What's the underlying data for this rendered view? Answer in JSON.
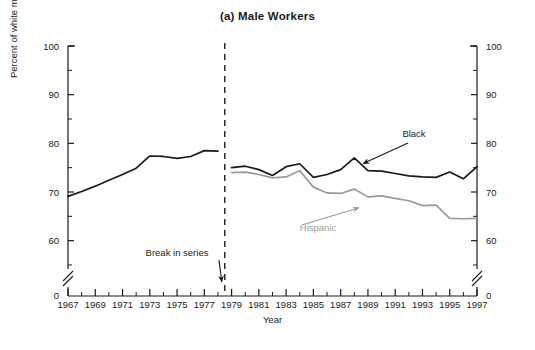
{
  "chart_data": {
    "type": "line",
    "title": "(a) Male Workers",
    "xlabel": "Year",
    "ylabel": "Percent of white male earnings",
    "xlim": [
      1967,
      1997
    ],
    "ylim": [
      0,
      100
    ],
    "y_axis_break": true,
    "y_break_below": 55,
    "grid": false,
    "legend": "inline-annotations",
    "y_major_ticks": [
      0,
      60,
      70,
      80,
      90,
      100
    ],
    "y_minor_ticks": [
      55,
      65,
      75,
      85,
      95
    ],
    "y_tick_labels": [
      "0",
      "60",
      "70",
      "80",
      "90",
      "100"
    ],
    "x_tick_labels": [
      "1967",
      "1969",
      "1971",
      "1973",
      "1975",
      "1977",
      "1979",
      "1981",
      "1983",
      "1985",
      "1987",
      "1989",
      "1991",
      "1993",
      "1995",
      "1997"
    ],
    "x_minor_years": [
      1968,
      1970,
      1972,
      1974,
      1976,
      1978,
      1980,
      1982,
      1984,
      1986,
      1988,
      1990,
      1992,
      1994,
      1996
    ],
    "break_in_series": {
      "label": "Break in series",
      "at_year": 1978.5,
      "style": "dashed-vertical"
    },
    "annotations": [
      {
        "text": "Black",
        "color": "#1a1a1a",
        "points_to_year": 1988.5,
        "points_to_value": 74.6
      },
      {
        "text": "Hispanic",
        "color": "#9a9a9a",
        "points_to_year": 1988.2,
        "points_to_value": 68.2
      }
    ],
    "series": [
      {
        "name": "Black",
        "color": "#1a1a1a",
        "segments": [
          {
            "name": "Black pre-break",
            "x": [
              1967,
              1968,
              1969,
              1970,
              1971,
              1972,
              1973,
              1974,
              1975,
              1976,
              1977,
              1978
            ],
            "y": [
              69.1,
              70.1,
              71.2,
              72.4,
              73.6,
              74.9,
              77.4,
              77.3,
              76.9,
              77.3,
              78.5,
              78.4
            ]
          },
          {
            "name": "Black post-break",
            "x": [
              1979,
              1980,
              1981,
              1982,
              1983,
              1984,
              1985,
              1986,
              1987,
              1988,
              1989,
              1990,
              1991,
              1992,
              1993,
              1994,
              1995,
              1996,
              1997
            ],
            "y": [
              75.0,
              75.3,
              74.6,
              73.4,
              75.2,
              75.8,
              73.0,
              73.6,
              74.6,
              77.0,
              74.4,
              74.3,
              73.8,
              73.3,
              73.1,
              73.0,
              74.1,
              72.7,
              75.2
            ]
          }
        ]
      },
      {
        "name": "Hispanic",
        "color": "#9a9a9a",
        "segments": [
          {
            "name": "Hispanic post-break",
            "x": [
              1979,
              1980,
              1981,
              1982,
              1983,
              1984,
              1985,
              1986,
              1987,
              1988,
              1989,
              1990,
              1991,
              1992,
              1993,
              1994,
              1995,
              1996,
              1997
            ],
            "y": [
              74.0,
              74.1,
              73.6,
              72.9,
              73.1,
              74.4,
              71.0,
              69.8,
              69.7,
              70.6,
              69.0,
              69.2,
              68.7,
              68.2,
              67.2,
              67.3,
              64.6,
              64.5,
              64.6
            ]
          }
        ]
      }
    ]
  }
}
